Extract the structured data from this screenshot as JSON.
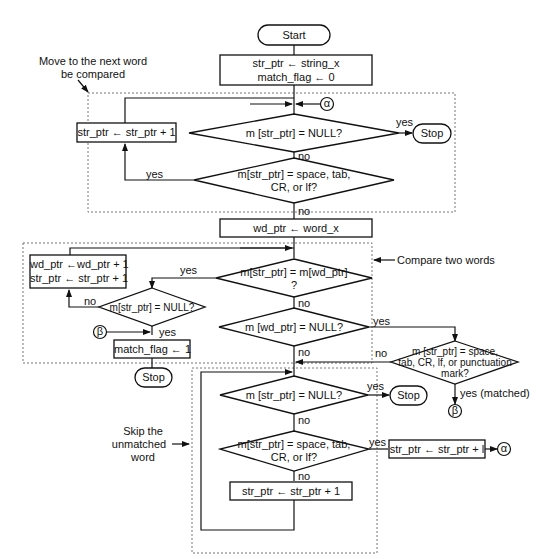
{
  "diagram": {
    "type": "flowchart",
    "annotations": {
      "move_next_word": "Move to the next word\nbe compared",
      "move_next_word_line1": "Move to the next word",
      "move_next_word_line2": "be compared",
      "compare_two_words": "Compare two words",
      "skip_unmatched_line1": "Skip the",
      "skip_unmatched_line2": "unmatched",
      "skip_unmatched_line3": "word"
    },
    "nodes": {
      "start": "Start",
      "init_line1": "str_ptr ← string_x",
      "init_line2": "match_flag ← 0",
      "connector_alpha": "α",
      "connector_beta": "β",
      "dec_null_1": "m [str_ptr] = NULL?",
      "stop_1": "Stop",
      "inc_str_1": "str_ptr ← str_ptr + 1",
      "dec_space_1_line1": "m[str_ptr] = space, tab,",
      "dec_space_1_line2": "CR, or lf?",
      "wd_init": "wd_ptr ← word_x",
      "dec_compare_line1": "m[str_ptr] = m[wd_ptr]",
      "dec_compare_line2": "?",
      "inc_both_line1": "wd_ptr ←wd_ptr + 1",
      "inc_both_line2": "str_ptr ← str_ptr + 1",
      "dec_null_2": "m[str_ptr] = NULL?",
      "match_flag_set": "match_flag ← 1",
      "stop_2": "Stop",
      "dec_wd_null": "m [wd_ptr] = NULL?",
      "dec_punct_line1": "m [str_ptr]  = space,",
      "dec_punct_line2": "tab, CR, lf, or punctuation",
      "dec_punct_line3": "mark?",
      "dec_null_3": "m [str_ptr] = NULL?",
      "stop_3": "Stop",
      "dec_space_2_line1": "m[str_ptr] = space, tab,",
      "dec_space_2_line2": "CR, or lf?",
      "inc_str_2": "str_ptr ← str_ptr + 1",
      "inc_str_alpha": "str_ptr  ← str_ptr + l"
    },
    "edge_labels": {
      "yes": "yes",
      "no": "no",
      "yes_matched": "yes (matched)"
    }
  }
}
